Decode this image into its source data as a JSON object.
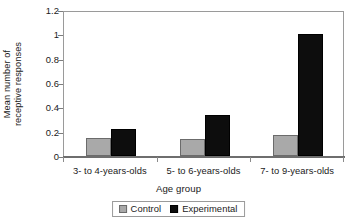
{
  "chart_data": {
    "type": "bar",
    "title": "",
    "xlabel": "Age group",
    "ylabel_line1": "Mean number of",
    "ylabel_line2": "receptive responses",
    "ylabel": "Mean number of receptive responses",
    "categories": [
      "3- to 4-years-olds",
      "5- to 6-years-olds",
      "7- to 9-years-olds"
    ],
    "series": [
      {
        "name": "Control",
        "color": "#a9a9a9",
        "values": [
          0.15,
          0.14,
          0.17
        ]
      },
      {
        "name": "Experimental",
        "color": "#0d0d0d",
        "values": [
          0.22,
          0.34,
          1.0
        ]
      }
    ],
    "ylim": [
      0,
      1.2
    ],
    "yticks": [
      "0",
      "0.2",
      "0.4",
      "0.6",
      "0.8",
      "1",
      "1.2"
    ],
    "ytick_values": [
      0,
      0.2,
      0.4,
      0.6,
      0.8,
      1,
      1.2
    ],
    "grid": false,
    "legend_position": "bottom-center",
    "legend": [
      {
        "label": "Control",
        "swatch": "control"
      },
      {
        "label": "Experimental",
        "swatch": "experimental"
      }
    ]
  }
}
